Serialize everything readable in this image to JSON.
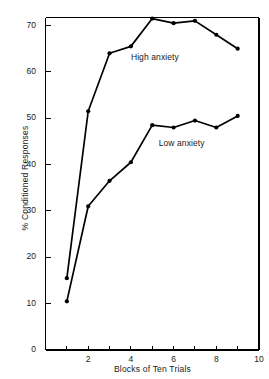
{
  "chart_data": {
    "type": "line",
    "title": "",
    "subtitle": "",
    "xlabel": "Blocks of Ten Trials",
    "ylabel": "% Conditioned Responses",
    "x": [
      1,
      2,
      3,
      4,
      5,
      6,
      7,
      8,
      9
    ],
    "xlim": [
      0,
      10
    ],
    "ylim": [
      0,
      74
    ],
    "xticks": [
      1,
      2,
      3,
      4,
      5,
      6,
      7,
      8,
      9,
      10
    ],
    "xtick_labels": [
      "",
      "2",
      "",
      "4",
      "",
      "6",
      "",
      "8",
      "",
      "10"
    ],
    "yticks": [
      0,
      10,
      20,
      30,
      40,
      50,
      60,
      70
    ],
    "ytick_labels": [
      "0",
      "10",
      "20",
      "30",
      "40",
      "50",
      "60",
      "70"
    ],
    "grid": false,
    "legend_position": "inline-annotations",
    "marker": "filled-circle",
    "line_color": "#000000",
    "series": [
      {
        "name": "High anxiety",
        "label_x": 4.0,
        "label_y": 63.0,
        "values": [
          15.5,
          51.5,
          64.0,
          65.5,
          71.5,
          70.5,
          71.0,
          68.0,
          65.0
        ]
      },
      {
        "name": "Low anxiety",
        "label_x": 5.3,
        "label_y": 44.5,
        "values": [
          10.5,
          31.0,
          36.5,
          40.5,
          48.5,
          48.0,
          49.5,
          48.0,
          50.5
        ]
      }
    ]
  }
}
